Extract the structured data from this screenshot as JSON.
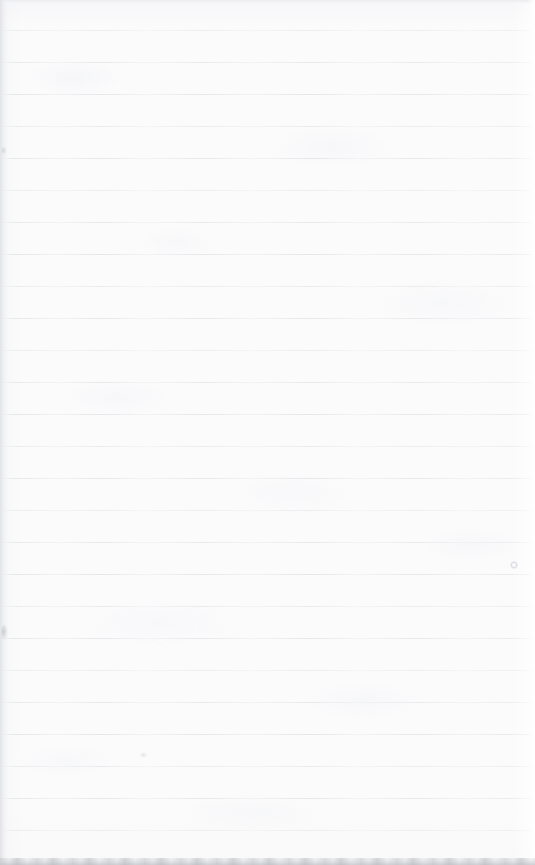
{
  "document": {
    "kind": "scanned-lined-paper",
    "title": "Blank ruled notebook page",
    "content_text": "",
    "is_blank": true,
    "width_px": 535,
    "height_px": 865
  },
  "paper": {
    "background_color": "#fbfbfc",
    "rule_color": "#e7e8ec",
    "rule_count": 26,
    "first_rule_y": 30,
    "rule_spacing": 32,
    "rule_thickness": 1
  },
  "edges": {
    "top_band_color": "#eaebed",
    "top_band_height": 5,
    "left_shadow_color": "#e0e1e5",
    "left_shadow_width": 9,
    "right_highlight_color": "#ffffff",
    "right_highlight_width": 7,
    "bottom_band_color": "#c4c5c9",
    "bottom_band_height": 7
  },
  "marks": [
    {
      "name": "left-edge-smudge",
      "x": 1,
      "y": 624,
      "w": 7,
      "h": 17
    },
    {
      "name": "left-upper-speck",
      "x": 1,
      "y": 146,
      "w": 6,
      "h": 9
    },
    {
      "name": "right-ring-speck",
      "x": 510,
      "y": 561,
      "w": 8,
      "h": 8
    },
    {
      "name": "mid-lower-speck",
      "x": 139,
      "y": 752,
      "w": 9,
      "h": 6
    }
  ]
}
